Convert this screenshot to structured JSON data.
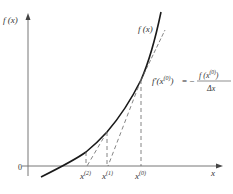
{
  "diagram": {
    "y_axis_label": "f (x)",
    "x_axis_label": "x",
    "origin_label": "0",
    "curve_label": "f (x)",
    "formula": {
      "lhs": "f′(x",
      "lhs_sup": "(0)",
      "lhs_close": ")",
      "equals": "= −",
      "numerator": "f (x",
      "numerator_sup": "(0)",
      "numerator_close": ")",
      "denominator": "Δx"
    },
    "x_ticks": [
      {
        "label": "x",
        "sup": "(2)"
      },
      {
        "label": "x",
        "sup": "(1)"
      },
      {
        "label": "x",
        "sup": "(0)"
      }
    ],
    "colors": {
      "curve": "#1a1a1a",
      "axes": "#555555",
      "dashed": "#555555"
    }
  }
}
